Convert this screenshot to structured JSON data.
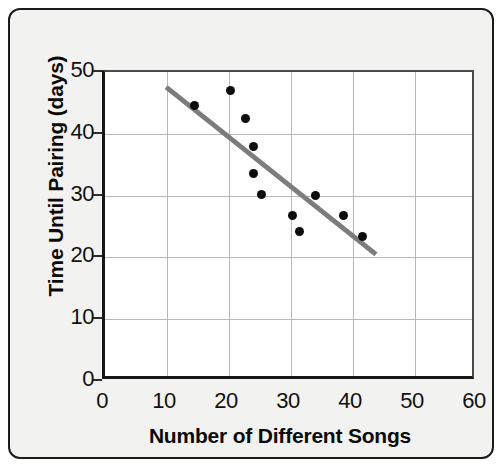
{
  "chart_data": {
    "type": "scatter",
    "title": "",
    "xlabel": "Number of Different Songs",
    "ylabel": "Time Until Pairing (days)",
    "xlim": [
      0,
      60
    ],
    "ylim": [
      0,
      50
    ],
    "xticks": [
      0,
      10,
      20,
      30,
      40,
      50,
      60
    ],
    "yticks": [
      0,
      10,
      20,
      30,
      40,
      50
    ],
    "xtick_labels": [
      "0",
      "10",
      "20",
      "30",
      "40",
      "50",
      "60"
    ],
    "ytick_labels": [
      "0",
      "10",
      "20",
      "30",
      "40",
      "50"
    ],
    "grid": true,
    "legend": null,
    "point_color": "#0d0d0d",
    "trendline_color": "#7c7c7c",
    "frame_color": "#1b1b1b",
    "background_color": "#f2f2f0",
    "plot_background_color": "#ffffff",
    "gridline_color": "#b8b8b8",
    "points": [
      {
        "x": 14.4,
        "y": 44.5
      },
      {
        "x": 20.3,
        "y": 47.0
      },
      {
        "x": 22.6,
        "y": 42.5
      },
      {
        "x": 23.9,
        "y": 38.0
      },
      {
        "x": 23.9,
        "y": 33.6
      },
      {
        "x": 25.2,
        "y": 30.2
      },
      {
        "x": 30.2,
        "y": 26.8
      },
      {
        "x": 31.4,
        "y": 24.2
      },
      {
        "x": 33.9,
        "y": 30.0
      },
      {
        "x": 38.4,
        "y": 26.7
      },
      {
        "x": 41.6,
        "y": 23.4
      }
    ],
    "trendline": {
      "x0": 10.0,
      "y0": 47.5,
      "x1": 44.3,
      "y1": 20.0
    }
  }
}
